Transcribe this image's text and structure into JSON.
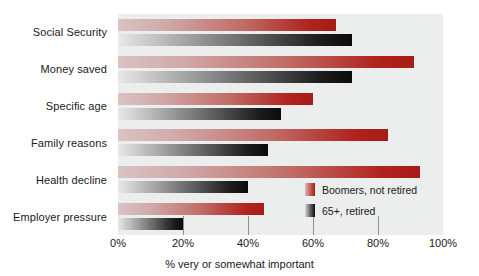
{
  "chart_data": {
    "type": "bar",
    "orientation": "horizontal",
    "title": "",
    "xlabel": "% very or somewhat important",
    "ylabel": "",
    "xlim": [
      0,
      100
    ],
    "xticks": [
      0,
      20,
      40,
      60,
      80,
      100
    ],
    "xticklabels": [
      "0%",
      "20%",
      "40%",
      "60%",
      "80%",
      "100%"
    ],
    "grid": false,
    "legend_position": "inside-right",
    "categories": [
      "Social Security",
      "Money saved",
      "Specific age",
      "Family reasons",
      "Health decline",
      "Employer pressure"
    ],
    "series": [
      {
        "name": "Boomers, not retired",
        "color": "#a71c16",
        "values": [
          67,
          91,
          60,
          83,
          93,
          45
        ]
      },
      {
        "name": "65+, retired",
        "color": "#0b0b0b",
        "values": [
          72,
          72,
          50,
          46,
          40,
          20
        ]
      }
    ]
  },
  "legend": {
    "items": [
      {
        "label": "Boomers, not retired",
        "swatch": "boomers-swatch"
      },
      {
        "label": "65+, retired",
        "swatch": "retired-swatch"
      }
    ]
  },
  "axis": {
    "x_title": "% very or somewhat important",
    "tick_labels": [
      "0%",
      "20%",
      "40%",
      "60%",
      "80%",
      "100%"
    ]
  }
}
